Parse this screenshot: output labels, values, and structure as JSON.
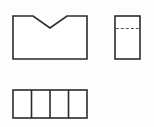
{
  "canvas": {
    "width": 154,
    "height": 127,
    "background_color": "#fdfdfd",
    "line_color": "#2b2b2b",
    "hidden_line_color": "#555555",
    "fill_color": "#ffffff"
  },
  "drawing": {
    "type": "orthographic-projection",
    "description": "Three-view engineering line drawing of a block with a V-shaped notch",
    "views": [
      {
        "id": "front-view",
        "name": "front-view-notched-rectangle",
        "position": "top-left",
        "shape": "rectangle-with-v-notch",
        "x": 13,
        "y": 16,
        "width": 74,
        "height": 43,
        "notch": {
          "name": "v-notch",
          "left_x": 33,
          "right_x": 67,
          "apex_x": 50,
          "apex_y": 28,
          "top_y": 16
        },
        "outline_points": "13,16 33,16 50,28 67,16 87,16 87,59 13,59"
      },
      {
        "id": "side-view",
        "name": "side-view-rectangle-with-hidden-line",
        "position": "top-right",
        "shape": "rectangle-with-hidden-line",
        "x": 115,
        "y": 16,
        "width": 25,
        "height": 43,
        "hidden_line": {
          "name": "hidden-edge-dashed",
          "y": 28,
          "x_start": 115,
          "x_end": 140,
          "style": "dashed"
        }
      },
      {
        "id": "top-view",
        "name": "top-view-divided-rectangle",
        "position": "bottom-left",
        "shape": "rectangle-with-vertical-dividers",
        "x": 13,
        "y": 90,
        "width": 74,
        "height": 28,
        "cell_count": 4,
        "divider_x_positions": [
          31.5,
          50,
          68.5
        ]
      }
    ]
  }
}
